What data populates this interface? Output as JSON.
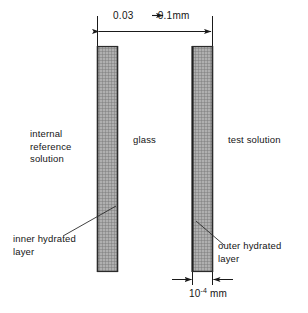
{
  "diagram": {
    "dimensions": {
      "top": {
        "name": "membrane-thickness",
        "text": "0.03 → 0.1mm",
        "from_value": "0.03",
        "to_value": "0.1",
        "unit": "mm"
      },
      "bottom": {
        "name": "hydrated-layer-thickness",
        "mantissa": "10",
        "exponent": "-4",
        "unit": " mm",
        "text": "10-4 mm"
      }
    },
    "labels": {
      "internal_reference_solution": "internal\nreference\nsolution",
      "glass": "glass",
      "test_solution": "test solution",
      "inner_hydrated_layer": "inner hydrated\nlayer",
      "outer_hydrated_layer": "outer hydrated\nlayer"
    },
    "colors": {
      "line": "#1a1a1a",
      "hatch_fill": "#a8a8a8",
      "hatch_line": "#6e6e6e",
      "bar_border": "#2b2b2b",
      "background": "#ffffff",
      "hydrated_layer": "#1f1f1f"
    },
    "geometry": {
      "left_bar": {
        "x": 97,
        "width": 21,
        "top": 46,
        "bottom": 272
      },
      "right_bar": {
        "x": 192,
        "width": 21,
        "top": 46,
        "bottom": 272
      }
    }
  }
}
